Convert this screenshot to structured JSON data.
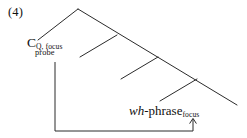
{
  "figure": {
    "example_number": "(4)",
    "type": "syntactic-tree-diagram"
  },
  "labels": {
    "c_head": "C",
    "c_subscript": "Q, focus",
    "c_probe": "probe",
    "wh_italic": "wh",
    "wh_main": "-phrase",
    "wh_subscript": "focus"
  },
  "icons": {
    "agree_arrow": "up-arrow"
  },
  "colors": {
    "ink": "#111111",
    "background": "#ffffff",
    "line": "#2b2b2b"
  },
  "geometry": {
    "apex": [
      78,
      9
    ],
    "main_diagonal_end": [
      237,
      105
    ],
    "left_branch_end": [
      38,
      40
    ],
    "internal_nodes": [
      [
        117,
        35
      ],
      [
        158,
        57
      ],
      [
        197,
        79
      ]
    ],
    "node_branch_ends": [
      [
        80,
        57
      ],
      [
        121,
        79
      ],
      [
        160,
        101
      ]
    ],
    "agree_path": [
      [
        55,
        62
      ],
      [
        55,
        131
      ],
      [
        193,
        131
      ],
      [
        193,
        118
      ]
    ]
  }
}
